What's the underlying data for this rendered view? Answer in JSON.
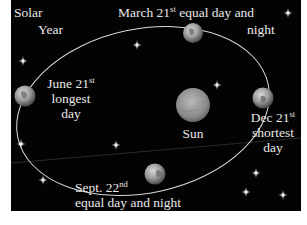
{
  "diagram": {
    "title_line1": "Solar",
    "title_line2": "Year",
    "sun": {
      "label": "Sun"
    },
    "positions": [
      {
        "id": "march",
        "date": "March 21",
        "suffix": "st",
        "line1_rest": " equal day and",
        "line2": "night"
      },
      {
        "id": "june",
        "date": "June 21",
        "suffix": "st",
        "line2": "longest",
        "line3": "day"
      },
      {
        "id": "dec",
        "date": "Dec 21",
        "suffix": "st",
        "line2": "shortest",
        "line3": "day"
      },
      {
        "id": "sept",
        "date": "Sept. 22",
        "suffix": "nd",
        "line2": "equal day and night"
      }
    ],
    "colors": {
      "background": "#030303",
      "orbit": "#d8d8d8",
      "text": "#e8e8e8",
      "earth": "#9a9a9a",
      "sun": "#8c8c8c"
    }
  }
}
